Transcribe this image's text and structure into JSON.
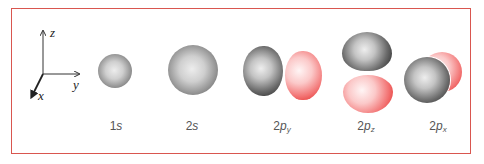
{
  "figure": {
    "frame_color": "#d9564f",
    "axes": {
      "z_label": "z",
      "y_label": "y",
      "x_label": "x"
    },
    "orbitals": [
      {
        "id": "1s",
        "main": "1",
        "letter": "s",
        "sub": ""
      },
      {
        "id": "2s",
        "main": "2",
        "letter": "s",
        "sub": ""
      },
      {
        "id": "2py",
        "main": "2",
        "letter": "p",
        "sub": "y"
      },
      {
        "id": "2pz",
        "main": "2",
        "letter": "p",
        "sub": "z"
      },
      {
        "id": "2px",
        "main": "2",
        "letter": "p",
        "sub": "x"
      }
    ],
    "colors": {
      "positive_lobe": "#3e3e3e",
      "negative_lobe": "#e0241e"
    }
  }
}
